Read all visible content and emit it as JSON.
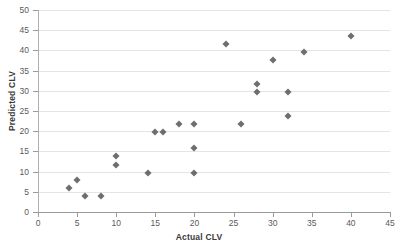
{
  "chart_data": {
    "type": "scatter",
    "title": "",
    "xlabel": "Actual CLV",
    "ylabel": "Predicted CLV",
    "xlim": [
      0,
      45
    ],
    "ylim": [
      0,
      50
    ],
    "xticks": [
      0,
      5,
      10,
      15,
      20,
      25,
      30,
      35,
      40,
      45
    ],
    "yticks": [
      0,
      5,
      10,
      15,
      20,
      25,
      30,
      35,
      40,
      45,
      50
    ],
    "grid": "horizontal",
    "legend": "none",
    "marker": {
      "shape": "diamond",
      "color": "#6e6e6e",
      "size": 5
    },
    "series": [
      {
        "name": "Customers",
        "points": [
          {
            "x": 4,
            "y": 5.9
          },
          {
            "x": 5,
            "y": 7.8
          },
          {
            "x": 6,
            "y": 3.9
          },
          {
            "x": 8,
            "y": 3.9
          },
          {
            "x": 10,
            "y": 13.9
          },
          {
            "x": 10,
            "y": 11.7
          },
          {
            "x": 14,
            "y": 9.7
          },
          {
            "x": 15,
            "y": 19.7
          },
          {
            "x": 16,
            "y": 19.7
          },
          {
            "x": 18,
            "y": 21.7
          },
          {
            "x": 20,
            "y": 21.7
          },
          {
            "x": 20,
            "y": 15.8
          },
          {
            "x": 20,
            "y": 9.7
          },
          {
            "x": 24,
            "y": 41.7
          },
          {
            "x": 26,
            "y": 21.7
          },
          {
            "x": 28,
            "y": 31.6
          },
          {
            "x": 28,
            "y": 29.6
          },
          {
            "x": 30,
            "y": 37.6
          },
          {
            "x": 32,
            "y": 29.6
          },
          {
            "x": 32,
            "y": 23.7
          },
          {
            "x": 34,
            "y": 39.6
          },
          {
            "x": 40,
            "y": 43.6
          }
        ]
      }
    ]
  }
}
